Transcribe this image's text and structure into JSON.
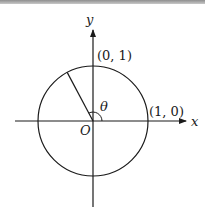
{
  "diagram": {
    "labels": {
      "y_axis": "y",
      "x_axis": "x",
      "origin": "O",
      "angle": "θ",
      "point_top": "(0, 1)",
      "point_right": "(1, 0)"
    },
    "geometry": {
      "center": [
        93,
        121
      ],
      "radius": 55,
      "angle_deg": 118,
      "x_axis_range": [
        15,
        186
      ],
      "y_axis_range": [
        30,
        207
      ]
    },
    "colors": {
      "stroke": "#1a1a1a",
      "background": "#ffffff",
      "top_band": "#9a9a9a"
    }
  }
}
